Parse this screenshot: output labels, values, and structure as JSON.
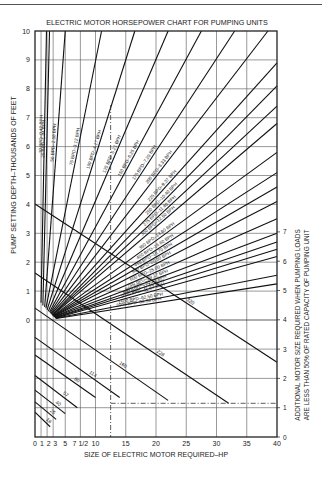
{
  "chart_data": {
    "type": "line",
    "title": "ELECTRIC MOTOR HORSEPOWER CHART FOR PUMPING UNITS",
    "xlabel": "SIZE OF ELECTRIC MOTOR REQUIRED–HP",
    "ylabel": "PUMP SETTING DEPTH–THOUSANDS OF FEET",
    "ylabel_right": [
      "ADDITIONAL MOTOR SIZE REQUIRED WHEN PUMPING LOADS",
      "ARE LESS THAN 50% OF RATED CAPACITY OF PUMPING UNIT"
    ],
    "xlim": [
      0,
      40
    ],
    "ylim": [
      0,
      10
    ],
    "ylim_right": [
      0,
      7
    ],
    "grid": true,
    "x_ticks": [
      "0",
      "1",
      "2",
      "3",
      "5",
      "7 1/2",
      "10",
      "15",
      "20",
      "25",
      "30",
      "35",
      "40"
    ],
    "x_tick_values": [
      0,
      1,
      2,
      3,
      5,
      7.5,
      10,
      15,
      20,
      25,
      30,
      35,
      40
    ],
    "y_ticks": [
      "0",
      "1",
      "2",
      "3",
      "4",
      "5",
      "6",
      "7",
      "8",
      "9",
      "10"
    ],
    "y_ticks_right": [
      "0",
      "1",
      "2",
      "3",
      "4",
      "5",
      "6",
      "7"
    ],
    "series": [
      {
        "name": "10 BPD–0.42 BPH",
        "x": [
          1.0,
          1.9
        ],
        "y": [
          0.6,
          10
        ]
      },
      {
        "name": "25 BPD–1.04 BPH",
        "x": [
          1.3,
          2.4
        ],
        "y": [
          0.5,
          10
        ]
      },
      {
        "name": "50 BPD–2.08 BPH",
        "x": [
          1.6,
          5.0
        ],
        "y": [
          0.45,
          10
        ]
      },
      {
        "name": "75 BPD–3.12 BPH",
        "x": [
          1.8,
          11.0
        ],
        "y": [
          0.4,
          10
        ]
      },
      {
        "name": "100 BPD–4.17 BPH",
        "x": [
          2.0,
          16.5
        ],
        "y": [
          0.35,
          10
        ]
      },
      {
        "name": "125 BPD–5.21 BPH",
        "x": [
          2.2,
          22.0
        ],
        "y": [
          0.3,
          10
        ]
      },
      {
        "name": "150 BPD–6.25 BPH",
        "x": [
          2.4,
          27.5
        ],
        "y": [
          0.28,
          10
        ]
      },
      {
        "name": "175 BPD–7.29 BPH",
        "x": [
          2.5,
          33.0
        ],
        "y": [
          0.25,
          10
        ]
      },
      {
        "name": "200 BPD–8.33 BPH",
        "x": [
          2.6,
          38.5
        ],
        "y": [
          0.22,
          10
        ]
      },
      {
        "name": "225 BPD–9.37 BPH",
        "x": [
          2.7,
          40
        ],
        "y": [
          0.2,
          8.9
        ]
      },
      {
        "name": "250 BPD–10.40 BPH",
        "x": [
          2.8,
          40
        ],
        "y": [
          0.18,
          8.1
        ]
      },
      {
        "name": "275 BPD–11.40 BPH",
        "x": [
          2.85,
          40
        ],
        "y": [
          0.17,
          7.4
        ]
      },
      {
        "name": "300 BPD–12.50 BPH",
        "x": [
          2.9,
          40
        ],
        "y": [
          0.16,
          6.8
        ]
      },
      {
        "name": "350 BPD–14.60 BPH",
        "x": [
          3.0,
          40
        ],
        "y": [
          0.15,
          5.8
        ]
      },
      {
        "name": "400 BPD–16.60 BPH",
        "x": [
          3.0,
          40
        ],
        "y": [
          0.14,
          5.1
        ]
      },
      {
        "name": "450 BPD–18.70 BPH",
        "x": [
          3.1,
          40
        ],
        "y": [
          0.13,
          4.6
        ]
      },
      {
        "name": "500 BPD–20.80 BPH",
        "x": [
          3.1,
          40
        ],
        "y": [
          0.12,
          4.1
        ]
      },
      {
        "name": "600 BPD–25.00 BPH",
        "x": [
          3.2,
          40
        ],
        "y": [
          0.11,
          3.5
        ]
      },
      {
        "name": "700 BPD–29.17 BPH",
        "x": [
          3.2,
          40
        ],
        "y": [
          0.1,
          3.0
        ]
      },
      {
        "name": "800 BPD–33.33 BPH",
        "x": [
          3.3,
          40
        ],
        "y": [
          0.09,
          2.7
        ]
      },
      {
        "name": "900 BPD–37.50 BPH",
        "x": [
          3.3,
          40
        ],
        "y": [
          0.08,
          2.45
        ]
      },
      {
        "name": "1000 BPD–41.67 BPH",
        "x": [
          3.4,
          40
        ],
        "y": [
          0.07,
          2.2
        ]
      },
      {
        "name": "1500 BPD–62.50 BPH",
        "x": [
          3.4,
          40
        ],
        "y": [
          0.06,
          1.55
        ]
      },
      {
        "name": "2000 BPD–83.33 BPH",
        "x": [
          3.5,
          40
        ],
        "y": [
          0.05,
          1.25
        ]
      }
    ],
    "unit_size_lines": [
      {
        "name": "320",
        "x": [
          0,
          40
        ],
        "y_right": [
          7.95,
          2.55
        ]
      },
      {
        "name": "228",
        "x": [
          0,
          32
        ],
        "y_right": [
          5.6,
          1.15
        ]
      },
      {
        "name": "160",
        "x": [
          0,
          22
        ],
        "y_right": [
          4.4,
          1.25
        ]
      },
      {
        "name": "114",
        "x": [
          0,
          14
        ],
        "y_right": [
          3.4,
          1.35
        ]
      },
      {
        "name": "80",
        "x": [
          0,
          10
        ],
        "y_right": [
          2.8,
          1.35
        ]
      },
      {
        "name": "57",
        "x": [
          0,
          7
        ],
        "y_right": [
          2.1,
          1.0
        ]
      },
      {
        "name": "40",
        "x": [
          0,
          5
        ],
        "y_right": [
          1.6,
          0.8
        ]
      },
      {
        "name": "25",
        "x": [
          0,
          3.5
        ],
        "y_right": [
          1.2,
          0.6
        ]
      },
      {
        "name": "16",
        "x": [
          0,
          2.5
        ],
        "y_right": [
          0.85,
          0.35
        ]
      }
    ],
    "annotations": [
      {
        "type": "dashed-vertical",
        "x": 12.5
      },
      {
        "type": "dashed-horizontal",
        "y_right": 1.15,
        "x": [
          12.5,
          40
        ]
      }
    ]
  }
}
